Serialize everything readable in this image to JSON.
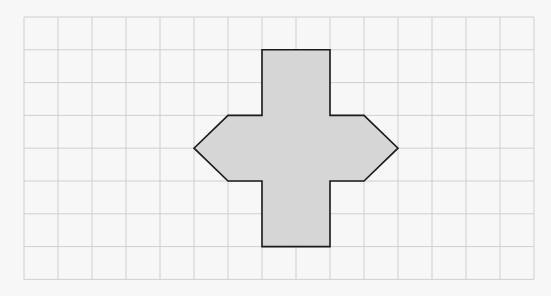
{
  "figure": {
    "type": "grid-shape",
    "grid": {
      "columns": 15,
      "rows": 8,
      "origin_px": [
        24,
        17
      ],
      "cell_w_px": 34,
      "cell_h_px": 32.8,
      "line_color": "#cfcfcf",
      "background": "#f7f7f7"
    },
    "shape": {
      "fill": "#d6d6d6",
      "stroke": "#1a1a1a",
      "stroke_width": 1.6,
      "vertices_grid_units": [
        [
          7,
          1
        ],
        [
          9,
          1
        ],
        [
          9,
          3
        ],
        [
          10,
          3
        ],
        [
          11,
          4
        ],
        [
          10,
          5
        ],
        [
          9,
          5
        ],
        [
          9,
          7
        ],
        [
          7,
          7
        ],
        [
          7,
          5
        ],
        [
          6,
          5
        ],
        [
          5,
          4
        ],
        [
          6,
          3
        ],
        [
          7,
          3
        ]
      ]
    }
  }
}
